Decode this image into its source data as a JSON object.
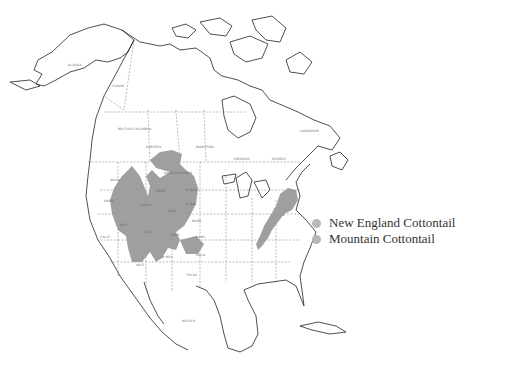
{
  "legend": {
    "items": [
      {
        "label": "New England Cottontail",
        "color": "#b8b8b8"
      },
      {
        "label": "Mountain Cottontail",
        "color": "#b8b8b8"
      }
    ]
  },
  "map": {
    "labels": {
      "alaska": "ALASKA",
      "yukon": "YUKON",
      "british_columbia": "BRITISH COLUMBIA",
      "alberta": "ALBERTA",
      "saskatchewan": "SASKATCHEWAN",
      "manitoba": "MANITOBA",
      "ontario": "ONTARIO",
      "quebec": "QUEBEC",
      "labrador": "LABRADOR",
      "mont": "MONT",
      "wyo": "WYO",
      "nev": "NEV",
      "utah": "UTAH",
      "colo": "COLO",
      "idaho": "IDAHO",
      "oreg": "OREG",
      "wash": "WASH",
      "calif": "CALIF",
      "ariz": "ARIZ",
      "n_mex": "N MEX",
      "n_dak": "N DAK",
      "s_dak": "S DAK",
      "nebr": "NEBR",
      "kans": "KANS",
      "okla": "OKLA",
      "texas": "TEXAS",
      "mexico": "MEXICO"
    },
    "shade_color": "#9a9a9a",
    "outline_color": "#222222"
  }
}
